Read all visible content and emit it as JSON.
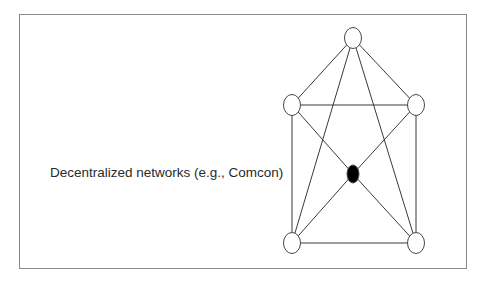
{
  "diagram": {
    "label": "Decentralized networks (e.g., Comcon)",
    "colors": {
      "frame": "#8a8a8a",
      "edge": "#3a3a3a",
      "node_stroke": "#4a4a4a",
      "node_fill": "#ffffff",
      "hub_fill": "#000000",
      "text": "#2a2a2a"
    },
    "nodes": [
      {
        "id": "top",
        "x": 353,
        "y": 38,
        "filled": false
      },
      {
        "id": "left",
        "x": 292,
        "y": 105,
        "filled": false
      },
      {
        "id": "right",
        "x": 416,
        "y": 105,
        "filled": false
      },
      {
        "id": "center",
        "x": 353,
        "y": 174,
        "filled": true
      },
      {
        "id": "bottom-left",
        "x": 292,
        "y": 243,
        "filled": false
      },
      {
        "id": "bottom-right",
        "x": 416,
        "y": 243,
        "filled": false
      }
    ],
    "edges": [
      [
        "top",
        "left"
      ],
      [
        "top",
        "right"
      ],
      [
        "top",
        "bottom-left"
      ],
      [
        "top",
        "bottom-right"
      ],
      [
        "left",
        "right"
      ],
      [
        "left",
        "bottom-left"
      ],
      [
        "right",
        "bottom-right"
      ],
      [
        "bottom-left",
        "bottom-right"
      ],
      [
        "left",
        "center"
      ],
      [
        "center",
        "bottom-right"
      ],
      [
        "right",
        "center"
      ],
      [
        "center",
        "bottom-left"
      ]
    ]
  }
}
